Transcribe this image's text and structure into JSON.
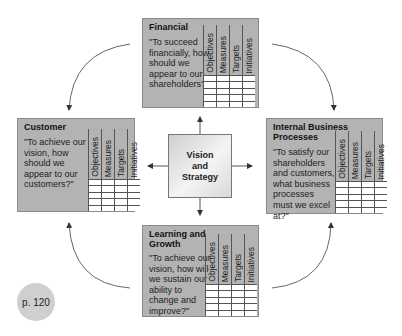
{
  "center": {
    "label_line1": "Vision",
    "label_line2": "and",
    "label_line3": "Strategy"
  },
  "grid_columns": [
    "Objectives",
    "Measures",
    "Targets",
    "Initiatives"
  ],
  "panels": {
    "financial": {
      "title": "Financial",
      "question": "\"To succeed financially, how should we appear to our shareholders?\""
    },
    "customer": {
      "title": "Customer",
      "question": "\"To achieve our vision, how should we appear to our customers?\""
    },
    "internal": {
      "title": "Internal Business Processes",
      "question": "\"To satisfy our shareholders and customers, what business processes must we excel at?\""
    },
    "learning": {
      "title": "Learning and Growth",
      "question": "\"To achieve our vision, how will we sustain our ability to change and improve?\""
    }
  },
  "page_badge": "p. 120",
  "colors": {
    "panel_bg": "#b3b3b3",
    "grid_cell": "#ffffff",
    "badge_bg": "#cfcfcf",
    "arrow": "#555555"
  }
}
